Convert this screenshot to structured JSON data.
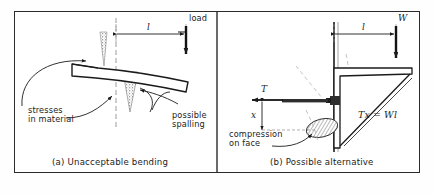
{
  "figure": {
    "frame_color": "#2b2b2b",
    "background": "#ffffff",
    "ink": "#1b1b1b"
  },
  "panel_a": {
    "caption": "(a)  Unacceptable bending",
    "labels": {
      "load": "load",
      "dimension_l": "l",
      "stresses_line1": "stresses",
      "stresses_line2": "in material",
      "spalling_line1": "possible",
      "spalling_line2": "spalling"
    },
    "icons": {
      "load_arrow": "down-arrow-icon",
      "dimension_arrows": "dimension-arrow-icon",
      "leader_stresses": "curved-leader-arrow-icon",
      "leader_spalling": "curved-leader-arrow-icon",
      "stress_cone_upper": "stippled-stress-cone-icon",
      "stress_cone_lower": "stippled-stress-cone-icon",
      "bent_beam": "bent-cantilever-beam-icon"
    }
  },
  "panel_b": {
    "caption": "(b)  Possible alternative",
    "labels": {
      "force_W": "W",
      "force_T": "T",
      "dimension_l": "l",
      "dimension_x": "x",
      "equation": "Tx = Wl",
      "compression_line1": "compression",
      "compression_line2": "on face"
    },
    "icons": {
      "load_arrow": "down-arrow-icon",
      "tension_arrow": "left-arrow-icon",
      "dimension_arrows": "dimension-arrow-icon",
      "bolt": "bolt-icon",
      "bracket": "angle-bracket-with-brace-icon",
      "compression_zone": "hatched-ellipse-icon",
      "leader_compression": "curved-leader-arrow-icon",
      "wall": "wall-line-icon"
    }
  }
}
